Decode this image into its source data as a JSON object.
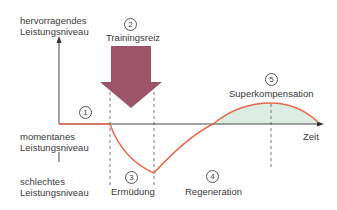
{
  "diagram": {
    "title": "Superkompensation",
    "y_axis": {
      "top_label_line1": "hervorragendes",
      "top_label_line2": "Leistungsniveau",
      "middle_label_line1": "momentanes",
      "middle_label_line2": "Leistungsniveau",
      "bottom_label_line1": "schlechtes",
      "bottom_label_line2": "Leistungsniveau"
    },
    "x_axis": {
      "label": "Zeit"
    },
    "phases": [
      {
        "number": "1",
        "label": ""
      },
      {
        "number": "2",
        "label": "Trainingsreiz"
      },
      {
        "number": "3",
        "label": "Ermüdung"
      },
      {
        "number": "4",
        "label": "Regeneration"
      },
      {
        "number": "5",
        "label": "Superkompensation"
      }
    ],
    "colors": {
      "curve": "#e8674a",
      "arrow": "#9b5468",
      "fill": "#dceee4",
      "axis": "#333333"
    }
  }
}
